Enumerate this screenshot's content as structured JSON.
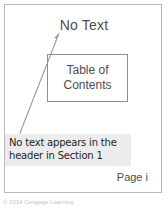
{
  "figure": {
    "header_label": "No Text",
    "toc_box": {
      "line1": "Table of",
      "line2": "Contents"
    },
    "page_number": "Page i",
    "callout": {
      "line1": "No text appears in the",
      "line2": "header in Section 1"
    },
    "credit": "© 2014 Cengage Learning",
    "colors": {
      "page_border": "#b9b9b9",
      "toc_border": "#8e8e8e",
      "callout_background": "#ececed",
      "arrow": "#9a9a9a",
      "text": "#4d4d4d",
      "callout_text": "#1f1f1f",
      "credit_text": "#c3c3c3"
    },
    "arrow": {
      "name": "leader-arrow",
      "from_x": 20,
      "from_y": 133,
      "to_x": 60,
      "to_y": 32
    }
  }
}
